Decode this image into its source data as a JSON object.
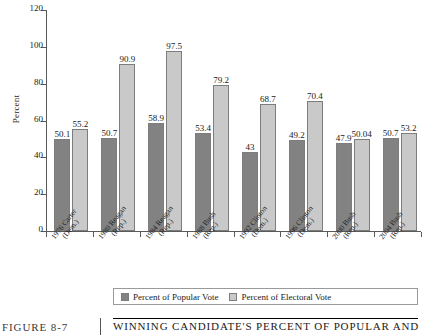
{
  "figure": {
    "number_label": "FIGURE 8-7",
    "caption": "WINNING CANDIDATE'S PERCENT OF POPULAR AND",
    "divider": ""
  },
  "legend": {
    "items": [
      {
        "label": "Percent of Popular Vote",
        "color": "#828282",
        "key": "popular"
      },
      {
        "label": "Percent of Electoral Vote",
        "color": "#c9c9c9",
        "key": "electoral"
      }
    ]
  },
  "axes": {
    "ylabel": "Percent",
    "yticks": [
      "0",
      "20",
      "40",
      "60",
      "80",
      "100",
      "120"
    ],
    "ymin": 0,
    "ymax": 120
  },
  "chart_data": {
    "type": "bar",
    "title": "WINNING CANDIDATE'S PERCENT OF POPULAR AND",
    "xlabel": "",
    "ylabel": "Percent",
    "ylim": [
      0,
      120
    ],
    "grid": false,
    "legend_position": "bottom",
    "categories": [
      "1976 Carter (Dem.)",
      "1980 Reagan (Rep.)",
      "1984 Reagan (Rep.)",
      "1988 Bush (Rep.)",
      "1992 Clinton (Dem.)",
      "1996 Clinton (Dem.)",
      "2000 Bush (Rep.)",
      "2004 Bush (Rep.)"
    ],
    "category_lines": [
      [
        "1976 Carter",
        "(Dem.)"
      ],
      [
        "1980 Reagan",
        "(Rep.)"
      ],
      [
        "1984 Reagan",
        "(Rep.)"
      ],
      [
        "1988 Bush",
        "(Rep.)"
      ],
      [
        "1992 Clinton",
        "(Dem.)"
      ],
      [
        "1996 Clinton",
        "(Dem.)"
      ],
      [
        "2000 Bush",
        "(Rep.)"
      ],
      [
        "2004 Bush",
        "(Rep.)"
      ]
    ],
    "series": [
      {
        "name": "Percent of Popular Vote",
        "color": "#828282",
        "values": [
          50.1,
          50.7,
          58.9,
          53.4,
          43,
          49.2,
          47.9,
          50.7
        ],
        "labels": [
          "50.1",
          "50.7",
          "58.9",
          "53.4",
          "43",
          "49.2",
          "47.9",
          "50.7"
        ]
      },
      {
        "name": "Percent of Electoral Vote",
        "color": "#c9c9c9",
        "values": [
          55.2,
          90.9,
          97.5,
          79.2,
          68.7,
          70.4,
          50.04,
          53.2
        ],
        "labels": [
          "55.2",
          "90.9",
          "97.5",
          "79.2",
          "68.7",
          "70.4",
          "50.04",
          "53.2"
        ]
      }
    ]
  }
}
